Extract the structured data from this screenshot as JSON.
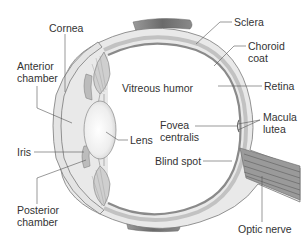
{
  "labels": {
    "cornea": "Cornea",
    "anterior_chamber_line1": "Anterior",
    "anterior_chamber_line2": "chamber",
    "vitreous_humor": "Vitreous humor",
    "lens": "Lens",
    "iris": "Iris",
    "posterior_chamber_line1": "Posterior",
    "posterior_chamber_line2": "chamber",
    "sclera": "Sclera",
    "choroid_coat_line1": "Choroid",
    "choroid_coat_line2": "coat",
    "retina": "Retina",
    "macula_lutea_line1": "Macula",
    "macula_lutea_line2": "lutea",
    "fovea_centralis_line1": "Fovea",
    "fovea_centralis_line2": "centralis",
    "blind_spot": "Blind spot",
    "optic_nerve": "Optic nerve"
  },
  "colors": {
    "background": "#ffffff",
    "outline": "#6e6e6e",
    "sclera_fill": "#e8e8e8",
    "choroid_fill": "#bdbdbd",
    "retina_fill": "#8c8c8c",
    "muscle_fill": "#7a7a7a",
    "lens_fill": "#efefef",
    "text": "#333333",
    "leader_line": "#555555"
  }
}
